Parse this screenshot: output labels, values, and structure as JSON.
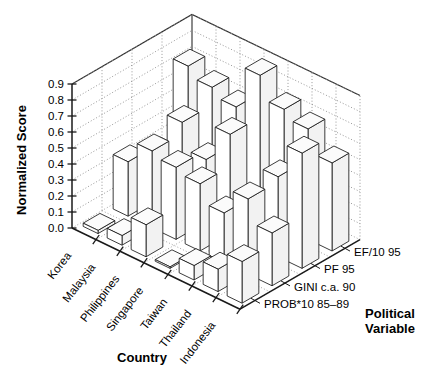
{
  "chart_data": {
    "type": "bar",
    "title": "",
    "subtitle": "",
    "projection": "3d",
    "xlabel": "Country",
    "ylabel": "Normalized Score",
    "zlabel": "Political Variable",
    "ylim": [
      0.0,
      0.9
    ],
    "grid": true,
    "legend_position": "depth-axis-right",
    "ytick_labels": [
      "0.0",
      "0.1",
      "0.2",
      "0.3",
      "0.4",
      "0.5",
      "0.6",
      "0.7",
      "0.8",
      "0.9"
    ],
    "ytick_values": [
      0.0,
      0.1,
      0.2,
      0.3,
      0.4,
      0.5,
      0.6,
      0.7,
      0.8,
      0.9
    ],
    "categories": [
      "Korea",
      "Malaysia",
      "Philippines",
      "Singapore",
      "Taiwan",
      "Thailand",
      "Indonesia"
    ],
    "series": [
      {
        "name": "PROB*10 85–89",
        "values": [
          0.02,
          0.06,
          0.2,
          0.01,
          0.09,
          0.14,
          0.26
        ]
      },
      {
        "name": "GINI c.a. 90",
        "values": [
          0.34,
          0.48,
          0.45,
          0.42,
          0.31,
          0.47,
          0.33
        ]
      },
      {
        "name": "PF 95",
        "values": [
          0.28,
          0.55,
          0.39,
          0.62,
          0.26,
          0.5,
          0.72
        ]
      },
      {
        "name": "EF/10 95",
        "values": [
          0.72,
          0.66,
          0.61,
          0.88,
          0.74,
          0.69,
          0.55
        ]
      }
    ]
  },
  "labels": {
    "y_axis_title": "Normalized Score",
    "x_axis_title": "Country",
    "z_axis_title_line1": "Political",
    "z_axis_title_line2": "Variable"
  }
}
